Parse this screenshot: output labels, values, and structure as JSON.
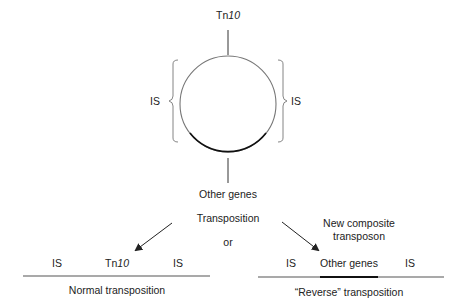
{
  "plasmid": {
    "top_label_prefix": "Tn",
    "top_label_number": "10",
    "left_label": "IS",
    "right_label": "IS",
    "bottom_label": "Other genes"
  },
  "center": {
    "transposition": "Transposition",
    "or": "or"
  },
  "right_annotation": {
    "line1": "New composite",
    "line2": "transposon"
  },
  "normal": {
    "left_is": "IS",
    "mid_prefix": "Tn",
    "mid_number": "10",
    "right_is": "IS",
    "caption": "Normal transposition"
  },
  "reverse": {
    "left_is": "IS",
    "mid": "Other genes",
    "right_is": "IS",
    "caption": "“Reverse” transposition"
  }
}
